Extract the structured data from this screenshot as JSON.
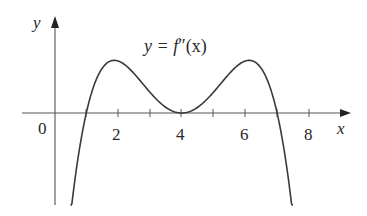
{
  "chart_data": {
    "type": "line",
    "title": "",
    "curve_label": "y = f″(x)",
    "xlabel": "x",
    "ylabel": "y",
    "xticks": [
      1,
      2,
      3,
      4,
      5,
      6,
      7,
      8
    ],
    "xtick_labels": [
      "0",
      "2",
      "4",
      "6",
      "8"
    ],
    "xlim": [
      -1.1,
      9.3
    ],
    "ylim": [
      -2.9,
      2.9
    ],
    "grid": false,
    "legend": "none",
    "series": [
      {
        "name": "f''(x)",
        "x": [
          0.5,
          1,
          1.5,
          2,
          2.5,
          3,
          3.5,
          4,
          4.5,
          5,
          5.5,
          6,
          6.5,
          7,
          7.5
        ],
        "y": [
          -2.9,
          0,
          1.3,
          1.6,
          1.3,
          0.7,
          0.2,
          0,
          0.2,
          0.7,
          1.3,
          1.6,
          1.3,
          0,
          -2.9
        ]
      }
    ],
    "features": {
      "zeros": [
        1,
        4,
        7
      ],
      "local_maxima": [
        {
          "x": 2,
          "y": 1.6
        },
        {
          "x": 6,
          "y": 1.6
        }
      ],
      "local_minimum_touching_axis": {
        "x": 4,
        "y": 0
      }
    }
  },
  "labels": {
    "y_axis": "y",
    "x_axis": "x",
    "origin": "0",
    "tick_2": "2",
    "tick_4": "4",
    "tick_6": "6",
    "tick_8": "8",
    "curve_lhs": "y = ",
    "curve_f": "f",
    "curve_primes": "″",
    "curve_rhs": "(x)"
  }
}
